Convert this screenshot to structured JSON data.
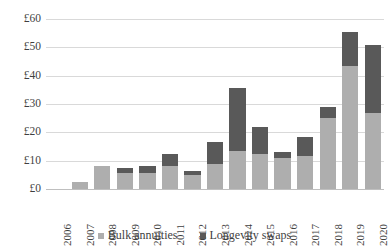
{
  "chart_data": {
    "type": "bar",
    "stacked": true,
    "title": "",
    "xlabel": "",
    "ylabel": "",
    "grid": true,
    "legend_position": "bottom",
    "currency_symbol": "£",
    "ylim": [
      0,
      60
    ],
    "yticks": [
      0,
      10,
      20,
      30,
      40,
      50,
      60
    ],
    "ytick_labels": [
      "£0",
      "£10",
      "£20",
      "£30",
      "£40",
      "£50",
      "£60"
    ],
    "categories": [
      "2006",
      "2007",
      "2008",
      "2009",
      "2010",
      "2011",
      "2012",
      "2013",
      "2014",
      "2015",
      "2016",
      "2017",
      "2018",
      "2019",
      "2020"
    ],
    "series": [
      {
        "name": "Bulk annuities",
        "color": "#aeaeae",
        "values": [
          0,
          2.5,
          8,
          5.5,
          5.5,
          8,
          5,
          9,
          13.5,
          12.5,
          11,
          11.5,
          25,
          43.5,
          27
        ]
      },
      {
        "name": "Longevity swaps",
        "color": "#595959",
        "values": [
          0,
          0,
          0,
          2,
          2.5,
          4.5,
          1.5,
          7.5,
          22,
          9.5,
          2,
          7,
          4,
          12,
          24
        ]
      }
    ],
    "totals": [
      0,
      2.5,
      8,
      7.5,
      8,
      12.5,
      6.5,
      16.5,
      35.5,
      22,
      13,
      18.5,
      29,
      55.5,
      51
    ]
  },
  "legend": {
    "items": [
      {
        "label": "Bulk annuities",
        "color": "#aeaeae"
      },
      {
        "label": "Longevity swaps",
        "color": "#595959"
      }
    ]
  }
}
